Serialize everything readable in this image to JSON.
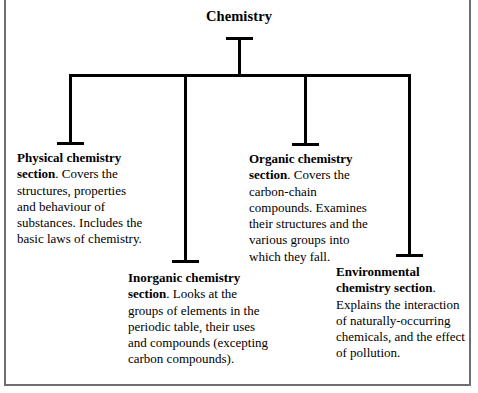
{
  "diagram": {
    "title": "Chemistry",
    "type": "hierarchy-tree",
    "root_label": "Chemistry",
    "branch_count": 4,
    "line_color": "#000000",
    "frame_color": "#6f6f6f",
    "background_color": "#ffffff"
  },
  "nodes": [
    {
      "id": "physical-chemistry",
      "lead": "Physical chemistry section",
      "lead_suffix": ".",
      "body": " Covers the structures, properties and behaviour of substances. Includes the basic laws of chemistry."
    },
    {
      "id": "inorganic-chemistry",
      "lead": "Inorganic chemistry section",
      "lead_suffix": ".",
      "body": " Looks at the groups of elements in the periodic table, their uses and compounds (excepting carbon compounds)."
    },
    {
      "id": "organic-chemistry",
      "lead": "Organic chemistry section",
      "lead_suffix": ".",
      "body": " Covers the carbon-chain compounds. Examines their structures and the various groups into which they fall."
    },
    {
      "id": "environmental-chemistry",
      "lead": "Environmental chemistry section",
      "lead_suffix": ".",
      "body": " Explains the interaction of naturally-occurring chemicals, and the effect of pollution."
    }
  ]
}
